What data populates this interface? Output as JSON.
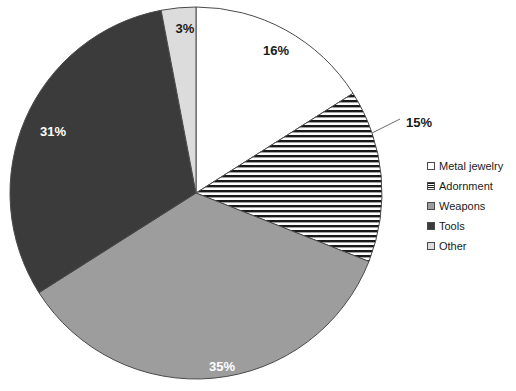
{
  "chart_data": {
    "type": "pie",
    "title": "",
    "xlabel": "",
    "ylabel": "",
    "legend_position": "right",
    "grid": false,
    "categories": [
      "Metal jewelry",
      "Adornment",
      "Weapons",
      "Tools",
      "Other"
    ],
    "values": [
      16,
      15,
      35,
      31,
      3
    ],
    "data_labels": [
      "16%",
      "15%",
      "35%",
      "31%",
      "3%"
    ],
    "slices": [
      {
        "label": "Metal jewelry",
        "value": 16,
        "data_label": "16%",
        "fill_style": "solid",
        "fill_color": "#ffffff",
        "label_color": "#1a1a1a",
        "label_x": 276,
        "label_y": 55,
        "leader": false
      },
      {
        "label": "Adornment",
        "value": 15,
        "data_label": "15%",
        "fill_style": "horizontal-stripes",
        "fill_color": "#ffffff",
        "label_color": "#1a1a1a",
        "label_x": 419,
        "label_y": 127,
        "leader": true,
        "leader_from_x": 372,
        "leader_from_y": 133,
        "leader_to_x": 400,
        "leader_to_y": 119
      },
      {
        "label": "Weapons",
        "value": 35,
        "data_label": "35%",
        "fill_style": "solid",
        "fill_color": "#9d9d9d",
        "label_color": "#ffffff",
        "label_x": 222,
        "label_y": 371,
        "leader": false
      },
      {
        "label": "Tools",
        "value": 31,
        "data_label": "31%",
        "fill_style": "solid",
        "fill_color": "#3b3b3b",
        "label_color": "#ffffff",
        "label_x": 53,
        "label_y": 136,
        "leader": false
      },
      {
        "label": "Other",
        "value": 3,
        "data_label": "3%",
        "fill_style": "solid",
        "fill_color": "#dcdcdc",
        "label_color": "#1a1a1a",
        "label_x": 185,
        "label_y": 33,
        "leader": false
      }
    ],
    "geometry": {
      "center_x": 196,
      "center_y": 193,
      "radius": 186,
      "start_angle_deg": -90,
      "direction": "clockwise"
    },
    "colors": {
      "metal_jewelry": "#ffffff",
      "adornment": "#ffffff",
      "weapons": "#9d9d9d",
      "tools": "#3b3b3b",
      "other": "#dcdcdc",
      "outline": "#4a4a4a",
      "stripe": "#1a1a1a"
    }
  },
  "legend": {
    "items": [
      {
        "label": "Metal jewelry",
        "swatch": "white-square-icon",
        "fill": "#ffffff",
        "pattern": "solid"
      },
      {
        "label": "Adornment",
        "swatch": "striped-square-icon",
        "fill": "#ffffff",
        "pattern": "horizontal-stripes"
      },
      {
        "label": "Weapons",
        "swatch": "gray-square-icon",
        "fill": "#9d9d9d",
        "pattern": "solid"
      },
      {
        "label": "Tools",
        "swatch": "dark-square-icon",
        "fill": "#3b3b3b",
        "pattern": "solid"
      },
      {
        "label": "Other",
        "swatch": "light-gray-square-icon",
        "fill": "#dcdcdc",
        "pattern": "solid"
      }
    ]
  }
}
